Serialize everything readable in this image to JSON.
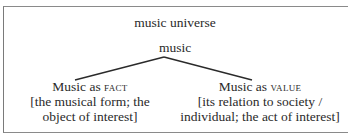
{
  "diagram": {
    "title": "music universe",
    "root": "music",
    "branches": [
      {
        "label_prefix": "Music as ",
        "label_keyword": "FACT",
        "description_line1": "[the musical form; the",
        "description_line2": "object of interest]"
      },
      {
        "label_prefix": "Music as ",
        "label_keyword": "VALUE",
        "description_line1": "[its relation to society /",
        "description_line2": "individual; the act of interest]"
      }
    ],
    "colors": {
      "line": "#2a2a2a",
      "frame": "#8a8a8a",
      "text": "#2a2a2a"
    }
  }
}
